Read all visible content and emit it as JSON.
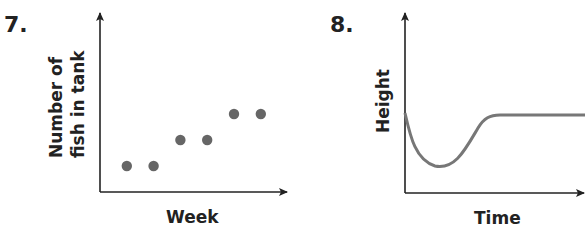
{
  "chart_data": [
    {
      "type": "scatter",
      "number": "7.",
      "title": "",
      "xlabel": "Week",
      "ylabel_line1": "Number of",
      "ylabel_line2": "fish in tank",
      "ylabel": "Number of fish in tank",
      "grid": false,
      "x": [
        1,
        2,
        3,
        4,
        5,
        6
      ],
      "y": [
        1,
        1,
        2,
        2,
        3,
        3
      ],
      "point_color": "#666666"
    },
    {
      "type": "line",
      "number": "8.",
      "title": "",
      "xlabel": "Time",
      "ylabel": "Height",
      "grid": false,
      "description": "Height starts at a moderate value, drops quickly to a minimum, rises back, then stays constant",
      "x": [
        0,
        0.5,
        1,
        1.5,
        2,
        3,
        4,
        6,
        8,
        10
      ],
      "y": [
        3.0,
        1.5,
        0.6,
        0.5,
        0.9,
        2.2,
        2.95,
        3.0,
        3.0,
        3.0
      ],
      "line_color": "#777777"
    }
  ]
}
